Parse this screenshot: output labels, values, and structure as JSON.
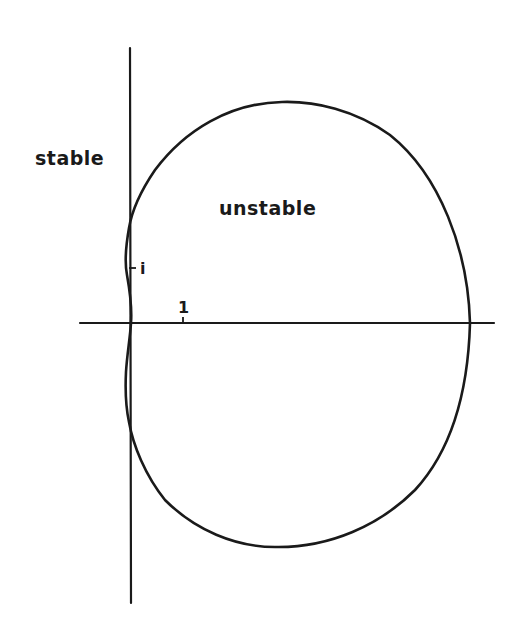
{
  "diagram": {
    "type": "stability-region-boundary-locus",
    "labels": {
      "stable": "stable",
      "unstable": "unstable"
    },
    "ticks": {
      "real_unit": "1",
      "imag_unit": "i"
    },
    "axes": {
      "horizontal": "real axis",
      "vertical": "imaginary axis"
    },
    "colors": {
      "ink": "#1a1a1a",
      "background": "#ffffff"
    }
  }
}
